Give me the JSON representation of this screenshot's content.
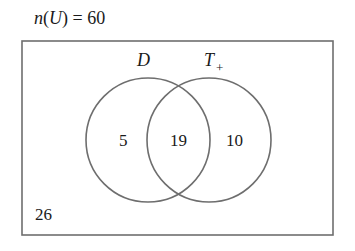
{
  "title": {
    "func": "n",
    "set": "U",
    "value": "60"
  },
  "sets": [
    {
      "name": "D",
      "subscript": ""
    },
    {
      "name": "T",
      "subscript": "+"
    }
  ],
  "regions": {
    "only_left": "5",
    "intersection": "19",
    "only_right": "10",
    "outside": "26"
  },
  "colors": {
    "stroke": "#6e6e6e",
    "text": "#1a1a1a"
  }
}
